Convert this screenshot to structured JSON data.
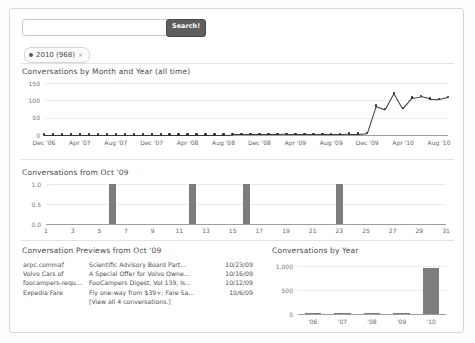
{
  "search": {
    "value": "",
    "placeholder": "",
    "button_label": "Search!"
  },
  "filter_chip": {
    "label": "2010 (968)",
    "close_glyph": "×",
    "dot_color": "#5a5a5a"
  },
  "sections": {
    "line_chart_title": "Conversations by Month and Year (all time)",
    "day_chart_title": "Conversations from Oct '09",
    "previews_title": "Conversation Previews from Oct '09",
    "year_chart_title": "Conversations by Year"
  },
  "previews": {
    "rows": [
      {
        "from": "arpc.commaf",
        "subject": "Scientific Advisory Board Part...",
        "date": "10/23/09"
      },
      {
        "from": "Volvo Cars of",
        "subject": "A Special Offer for Volvo Owne...",
        "date": "10/16/09"
      },
      {
        "from": "foocampers-requ...",
        "subject": "FooCampers Digest, Vol 139, Is...",
        "date": "10/12/09"
      },
      {
        "from": "Expedia Fare",
        "subject": "Fly one-way from $39+: Fare Sa...",
        "date": "10/6/09"
      }
    ],
    "view_all_label": "[View all 4 conversations.]"
  },
  "colors": {
    "bar": "#7d7d7d",
    "line": "#3a3a3a",
    "grid": "#ececec",
    "axis": "#9e9e9e",
    "button": "#5e5e5e"
  },
  "chart_data": [
    {
      "id": "conversations-by-month",
      "type": "line",
      "title": "Conversations by Month and Year (all time)",
      "xlabel": "",
      "ylabel": "",
      "ylim": [
        0,
        150
      ],
      "yticks": [
        0,
        50,
        100,
        150
      ],
      "grid": true,
      "legend": "none",
      "xtick_labels": [
        "Dec '06",
        "Apr '07",
        "Aug '07",
        "Dec '07",
        "Apr '08",
        "Aug '08",
        "Dec '08",
        "Apr '09",
        "Aug '09",
        "Dec '09",
        "Apr '10",
        "Aug '10"
      ],
      "x": [
        "Dec '06",
        "Jan '07",
        "Feb '07",
        "Mar '07",
        "Apr '07",
        "May '07",
        "Jun '07",
        "Jul '07",
        "Aug '07",
        "Sep '07",
        "Oct '07",
        "Nov '07",
        "Dec '07",
        "Jan '08",
        "Feb '08",
        "Mar '08",
        "Apr '08",
        "May '08",
        "Jun '08",
        "Jul '08",
        "Aug '08",
        "Sep '08",
        "Oct '08",
        "Nov '08",
        "Dec '08",
        "Jan '09",
        "Feb '09",
        "Mar '09",
        "Apr '09",
        "May '09",
        "Jun '09",
        "Jul '09",
        "Aug '09",
        "Sep '09",
        "Oct '09",
        "Nov '09",
        "Dec '09",
        "Jan '10",
        "Feb '10",
        "Mar '10",
        "Apr '10",
        "May '10",
        "Jun '10",
        "Jul '10",
        "Aug '10",
        "Sep '10"
      ],
      "values": [
        1,
        1,
        1,
        1,
        1,
        1,
        1,
        1,
        1,
        1,
        1,
        1,
        1,
        1,
        1,
        1,
        1,
        1,
        1,
        1,
        1,
        2,
        2,
        2,
        2,
        2,
        2,
        3,
        3,
        3,
        3,
        3,
        3,
        3,
        4,
        4,
        6,
        85,
        75,
        122,
        77,
        108,
        112,
        105,
        104,
        110
      ]
    },
    {
      "id": "conversations-from-oct-09",
      "type": "bar",
      "title": "Conversations from Oct '09",
      "xlabel": "",
      "ylabel": "",
      "ylim": [
        0,
        1.0
      ],
      "yticks": [
        "0.0",
        "0.5",
        "1.0"
      ],
      "grid": true,
      "legend": "none",
      "xtick_labels": [
        "1",
        "3",
        "5",
        "7",
        "9",
        "11",
        "13",
        "15",
        "17",
        "19",
        "21",
        "23",
        "25",
        "27",
        "29",
        "31"
      ],
      "categories": [
        1,
        2,
        3,
        4,
        5,
        6,
        7,
        8,
        9,
        10,
        11,
        12,
        13,
        14,
        15,
        16,
        17,
        18,
        19,
        20,
        21,
        22,
        23,
        24,
        25,
        26,
        27,
        28,
        29,
        30,
        31
      ],
      "values": [
        0,
        0,
        0,
        0,
        0,
        1,
        0,
        0,
        0,
        0,
        0,
        1,
        0,
        0,
        0,
        1,
        0,
        0,
        0,
        0,
        0,
        0,
        1,
        0,
        0,
        0,
        0,
        0,
        0,
        0,
        0
      ]
    },
    {
      "id": "conversations-by-year",
      "type": "bar",
      "title": "Conversations by Year",
      "xlabel": "",
      "ylabel": "",
      "ylim": [
        0,
        1000
      ],
      "yticks": [
        "0",
        "500",
        "1,000"
      ],
      "grid": true,
      "legend": "none",
      "categories": [
        "'06",
        "'07",
        "'08",
        "'09",
        "'10"
      ],
      "values": [
        2,
        3,
        4,
        28,
        968
      ]
    }
  ]
}
